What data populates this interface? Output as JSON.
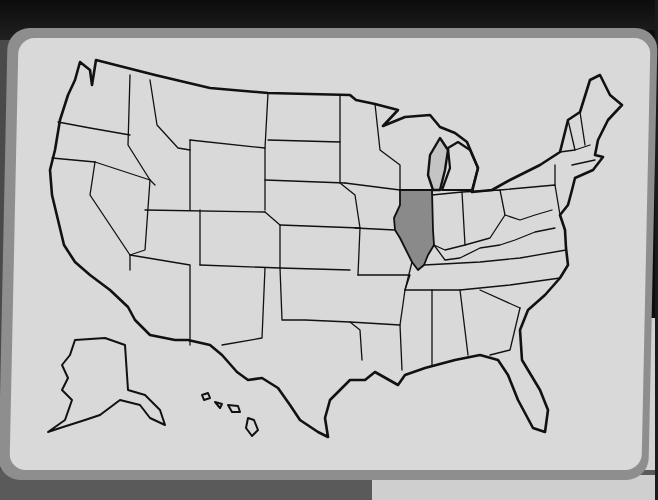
{
  "scene": {
    "subject": "United States outline map card",
    "highlighted_state": "Illinois",
    "colors": {
      "card_fill": "#d9d9d9",
      "card_border": "#8e8e8e",
      "outline": "#111111",
      "highlight": "#8a8a8a",
      "great_lakes": "#c4c4c4"
    }
  }
}
